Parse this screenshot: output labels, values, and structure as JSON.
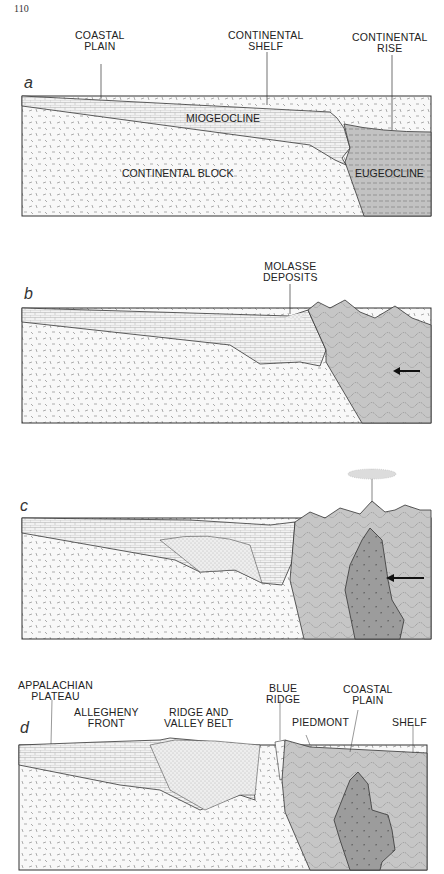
{
  "page_number": "110",
  "colors": {
    "continental_block": "#f7f7f7",
    "sediment_wedge": "#f0f0f0",
    "eugeocline": "#c2c2c2",
    "deformed_terrane": "#c6c6c6",
    "granite_pluton": "#9a9a9a",
    "outline": "#333333"
  },
  "panels": {
    "a": {
      "label": "a",
      "callouts": [
        "COASTAL\nPLAIN",
        "CONTINENTAL\nSHELF",
        "CONTINENTAL\nRISE"
      ],
      "callout_lines": {
        "coastal_plain": "COASTAL",
        "coastal_plain_2": "PLAIN",
        "shelf_1": "CONTINENTAL",
        "shelf_2": "SHELF",
        "rise_1": "CONTINENTAL",
        "rise_2": "RISE"
      },
      "inner_labels": {
        "miogeocline": "MIOGEOCLINE",
        "continental_block": "CONTINENTAL BLOCK",
        "eugeocline": "EUGEOCLINE"
      }
    },
    "b": {
      "label": "b",
      "callout_lines": {
        "molasse_1": "MOLASSE",
        "molasse_2": "DEPOSITS"
      },
      "arrow": "compression-arrow-left"
    },
    "c": {
      "label": "c",
      "features": [
        "volcanic-plume",
        "granite-pluton"
      ],
      "arrow": "compression-arrow-left"
    },
    "d": {
      "label": "d",
      "callout_lines": {
        "appalachian_1": "APPALACHIAN",
        "appalachian_2": "PLATEAU",
        "allegheny_1": "ALLEGHENY",
        "allegheny_2": "FRONT",
        "ridge_1": "RIDGE AND",
        "ridge_2": "VALLEY BELT",
        "blue_1": "BLUE",
        "blue_2": "RIDGE",
        "piedmont": "PIEDMONT",
        "coastal_1": "COASTAL",
        "coastal_2": "PLAIN",
        "shelf": "SHELF"
      }
    }
  }
}
